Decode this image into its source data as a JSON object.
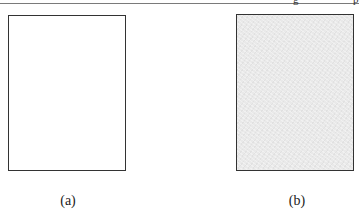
{
  "header": {
    "fragments": [
      "g",
      "p"
    ]
  },
  "figure": {
    "panels": [
      {
        "id": "a",
        "caption": "(a)",
        "fill": "#ffffff",
        "description": "empty white page"
      },
      {
        "id": "b",
        "caption": "(b)",
        "fill": "#e9e9e9",
        "description": "noisy light-gray page"
      }
    ]
  }
}
